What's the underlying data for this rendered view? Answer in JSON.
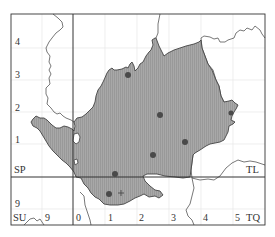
{
  "map": {
    "grid_squares": {
      "SP": "SP",
      "TL": "TL",
      "SU": "SU",
      "TQ": "TQ"
    },
    "y_ticks": [
      {
        "label": "4",
        "y": 42
      },
      {
        "label": "3",
        "y": 75
      },
      {
        "label": "2",
        "y": 108
      },
      {
        "label": "1",
        "y": 140
      },
      {
        "label": "9",
        "y": 204
      }
    ],
    "x_ticks": [
      {
        "label": "9",
        "x": 47
      },
      {
        "label": "0",
        "x": 78
      },
      {
        "label": "1",
        "x": 110
      },
      {
        "label": "2",
        "x": 141
      },
      {
        "label": "3",
        "x": 173
      },
      {
        "label": "4",
        "x": 205
      },
      {
        "label": "5",
        "x": 237
      }
    ],
    "colors": {
      "fill": "#a8a8a8",
      "hatch": "#8c8c8c",
      "border": "#444444",
      "grid": "#e4e4e4",
      "dot": "#4a4a4a"
    },
    "records": [
      {
        "type": "dot",
        "x": 128,
        "y": 75
      },
      {
        "type": "dot",
        "x": 160,
        "y": 115
      },
      {
        "type": "dot",
        "x": 185,
        "y": 142
      },
      {
        "type": "dot",
        "x": 153,
        "y": 155
      },
      {
        "type": "dot",
        "x": 115,
        "y": 174
      },
      {
        "type": "dot",
        "x": 109,
        "y": 194
      },
      {
        "type": "cross",
        "x": 121,
        "y": 193
      },
      {
        "type": "dot",
        "x": 231,
        "y": 113
      }
    ]
  }
}
